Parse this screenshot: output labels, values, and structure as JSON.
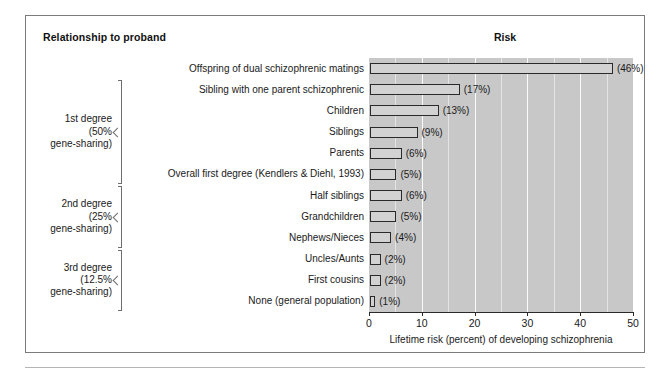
{
  "figure": {
    "header_left": "Relationship to proband",
    "header_right": "Risk"
  },
  "chart_data": {
    "type": "bar",
    "orientation": "horizontal",
    "title": "Risk",
    "xlabel": "Lifetime risk (percent) of developing schizophrenia",
    "ylabel": "Relationship to proband",
    "xlim": [
      0,
      50
    ],
    "xticks": [
      0,
      10,
      20,
      30,
      40,
      50
    ],
    "xtick_labels": [
      "0",
      "10",
      "20",
      "30",
      "40",
      "50"
    ],
    "grid": "vertical-minor-every-5",
    "legend": "none",
    "categories": [
      "Offspring of dual schizophrenic matings",
      "Sibling with one parent schizophrenic",
      "Children",
      "Siblings",
      "Parents",
      "Overall first degree (Kendlers & Diehl, 1993)",
      "Half siblings",
      "Grandchildren",
      "Nephews/Nieces",
      "Uncles/Aunts",
      "First cousins",
      "None (general population)"
    ],
    "values": [
      46,
      17,
      13,
      9,
      6,
      5,
      6,
      5,
      4,
      2,
      2,
      1
    ],
    "value_labels": [
      "(46%)",
      "(17%)",
      "(13%)",
      "(9%)",
      "(6%)",
      "(5%)",
      "(6%)",
      "(5%)",
      "(4%)",
      "(2%)",
      "(2%)",
      "(1%)"
    ],
    "groups": [
      {
        "lines": [
          "1st degree",
          "(50%",
          "gene-sharing)"
        ],
        "text": "1st degree\n(50%\ngene-sharing)",
        "first_index": 1,
        "last_index": 5
      },
      {
        "lines": [
          "2nd degree",
          "(25%",
          "gene-sharing)"
        ],
        "text": "2nd degree\n(25%\ngene-sharing)",
        "first_index": 6,
        "last_index": 8
      },
      {
        "lines": [
          "3rd degree",
          "(12.5%",
          "gene-sharing)"
        ],
        "text": "3rd degree\n(12.5%\ngene-sharing)",
        "first_index": 9,
        "last_index": 11
      }
    ],
    "colors": {
      "plot_background": "#c8c8c8",
      "bar_fill": "#d2d2d2",
      "bar_outline": "#2a2a2a",
      "gridline": "#fbfbfb",
      "text": "#1a1a1a",
      "frame": "#7b7b7b"
    }
  }
}
